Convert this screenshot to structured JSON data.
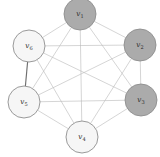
{
  "figure": {
    "width": 160,
    "height": 157,
    "background": "#ffffff"
  },
  "style": {
    "edge_color": "#b9b9b9",
    "edge_emphasis_color": "#6e6e6e",
    "node_stroke": "#8f8f8f",
    "node_fill_dark": "#ababab",
    "node_fill_light": "#f6f6f6",
    "label_color": "#2b2b2b"
  },
  "graph_data": {
    "type": "graph",
    "layout": "hexagonal",
    "node_count": 6,
    "edge_count": 15,
    "nodes": [
      {
        "id": "v1",
        "label": "v",
        "subscript": "1",
        "x": 80,
        "y": 14,
        "r": 16,
        "fill": "dark",
        "name": "node-v1"
      },
      {
        "id": "v2",
        "label": "v",
        "subscript": "2",
        "x": 140,
        "y": 45,
        "r": 16,
        "fill": "dark",
        "name": "node-v2"
      },
      {
        "id": "v3",
        "label": "v",
        "subscript": "3",
        "x": 141,
        "y": 100,
        "r": 16,
        "fill": "dark",
        "name": "node-v3"
      },
      {
        "id": "v4",
        "label": "v",
        "subscript": "4",
        "x": 82,
        "y": 137,
        "r": 16,
        "fill": "light",
        "name": "node-v4"
      },
      {
        "id": "v5",
        "label": "v",
        "subscript": "5",
        "x": 24,
        "y": 102,
        "r": 16,
        "fill": "light",
        "name": "node-v5"
      },
      {
        "id": "v6",
        "label": "v",
        "subscript": "6",
        "x": 29,
        "y": 46,
        "r": 16,
        "fill": "light",
        "name": "node-v6"
      }
    ],
    "edges": [
      {
        "source": "v1",
        "target": "v2",
        "emphasis": false
      },
      {
        "source": "v1",
        "target": "v3",
        "emphasis": false
      },
      {
        "source": "v1",
        "target": "v4",
        "emphasis": false
      },
      {
        "source": "v1",
        "target": "v5",
        "emphasis": false
      },
      {
        "source": "v1",
        "target": "v6",
        "emphasis": false
      },
      {
        "source": "v2",
        "target": "v3",
        "emphasis": false
      },
      {
        "source": "v2",
        "target": "v4",
        "emphasis": false
      },
      {
        "source": "v2",
        "target": "v5",
        "emphasis": false
      },
      {
        "source": "v2",
        "target": "v6",
        "emphasis": false
      },
      {
        "source": "v3",
        "target": "v4",
        "emphasis": false
      },
      {
        "source": "v3",
        "target": "v5",
        "emphasis": false
      },
      {
        "source": "v3",
        "target": "v6",
        "emphasis": false
      },
      {
        "source": "v4",
        "target": "v5",
        "emphasis": false
      },
      {
        "source": "v4",
        "target": "v6",
        "emphasis": false
      },
      {
        "source": "v5",
        "target": "v6",
        "emphasis": true
      }
    ]
  }
}
